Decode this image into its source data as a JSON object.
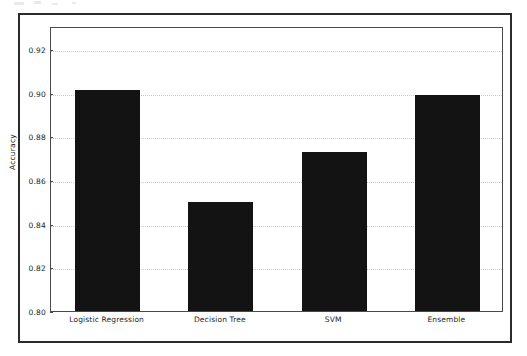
{
  "chart_data": {
    "type": "bar",
    "title": "",
    "xlabel": "",
    "ylabel": "Accuracy",
    "categories": [
      "Logistic Regression",
      "Decision Tree",
      "SVM",
      "Ensemble"
    ],
    "values": [
      0.901,
      0.85,
      0.873,
      0.899
    ],
    "ylim": [
      0.8,
      0.9305
    ],
    "yticks": [
      0.8,
      0.82,
      0.84,
      0.86,
      0.88,
      0.9,
      0.92
    ],
    "ytick_labels": [
      "0.80",
      "0.82",
      "0.84",
      "0.86",
      "0.88",
      "0.90",
      "0.92"
    ],
    "grid": true,
    "grid_axis": "y",
    "legend": "none",
    "bar_color": "#131313",
    "grid_color": "#c9c9c9",
    "axis_color": "#4a4a4a",
    "frame_color": "#2b2b2b",
    "background_color": "#ffffff"
  }
}
